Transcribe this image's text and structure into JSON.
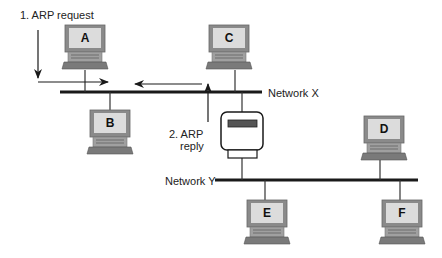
{
  "diagram": {
    "networks": [
      {
        "id": "network-x",
        "label": "Network X"
      },
      {
        "id": "network-y",
        "label": "Network Y"
      }
    ],
    "hosts": [
      {
        "id": "A",
        "label": "A",
        "network": "Network X"
      },
      {
        "id": "B",
        "label": "B",
        "network": "Network X"
      },
      {
        "id": "C",
        "label": "C",
        "network": "Network X"
      },
      {
        "id": "D",
        "label": "D",
        "network": "Network Y"
      },
      {
        "id": "E",
        "label": "E",
        "network": "Network Y"
      },
      {
        "id": "F",
        "label": "F",
        "network": "Network Y"
      }
    ],
    "router": {
      "label": "",
      "connects": [
        "Network X",
        "Network Y"
      ]
    },
    "steps": [
      {
        "label": "1. ARP request"
      },
      {
        "label_line1": "2. ARP",
        "label_line2": "reply"
      }
    ],
    "colors": {
      "line": "#1a1a1a",
      "monitor_frame": "#8a8a8a",
      "screen": "#d9d9d9",
      "base": "#9a9a9a",
      "keyboard": "#777777"
    }
  }
}
